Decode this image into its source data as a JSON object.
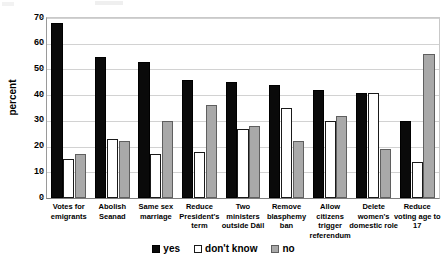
{
  "chart_data": {
    "type": "bar",
    "title": "",
    "xlabel": "",
    "ylabel": "percent",
    "ylim": [
      0,
      70
    ],
    "yticks": [
      0,
      10,
      20,
      30,
      40,
      50,
      60,
      70
    ],
    "grid": true,
    "legend_position": "bottom",
    "categories": [
      "Votes for emigrants",
      "Abolish Seanad",
      "Same sex marriage",
      "Reduce President's term",
      "Two ministers outside Dáil",
      "Remove blasphemy ban",
      "Allow citizens trigger referendum",
      "Delete women's domestic role",
      "Reduce voting age to 17"
    ],
    "series": [
      {
        "name": "yes",
        "color": "#0a0a0a",
        "values": [
          68,
          55,
          53,
          46,
          45,
          44,
          42,
          41,
          30
        ]
      },
      {
        "name": "don't know",
        "color": "#ffffff",
        "values": [
          15,
          23,
          17,
          18,
          27,
          35,
          30,
          41,
          14
        ]
      },
      {
        "name": "no",
        "color": "#a9a9a9",
        "values": [
          17,
          22,
          30,
          36,
          28,
          22,
          32,
          19,
          56
        ]
      }
    ]
  },
  "axis": {
    "y_title": "percent",
    "y_tick_labels": [
      "70",
      "60",
      "50",
      "40",
      "30",
      "20",
      "10",
      "0"
    ]
  },
  "legend": {
    "items": [
      {
        "label": "yes"
      },
      {
        "label": "don't know"
      },
      {
        "label": "no"
      }
    ]
  }
}
